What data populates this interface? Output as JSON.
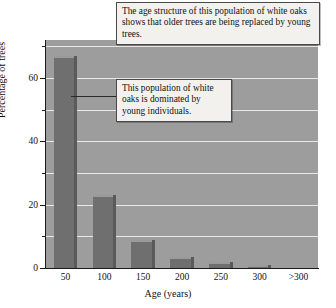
{
  "chart_data": {
    "type": "bar",
    "title": "",
    "xlabel": "Age (years)",
    "ylabel": "Percentage of trees",
    "categories": [
      "50",
      "100",
      "150",
      "200",
      "250",
      "300",
      ">300"
    ],
    "values": [
      67,
      23,
      9,
      3.5,
      2,
      0.8,
      0
    ],
    "ylim": [
      0,
      72
    ],
    "yticks_major": [
      0,
      20,
      40,
      60
    ],
    "yticks_minor": [
      10,
      30,
      50,
      70
    ],
    "ytick_labels": [
      "0",
      "20",
      "40",
      "60"
    ],
    "grid": "horizontal white gridlines every 10 units",
    "legend": "none",
    "colors": {
      "plot_background": "#9d9d9d",
      "bar_fill": "#6f6f6f",
      "bar_highlight": "#9a9a9a",
      "bar_shadow": "#5a5a5a",
      "gridline": "#e8e8e8",
      "axis": "#1b1b1b",
      "page_background": "#ffffff",
      "callout_background": "#f2f1ee",
      "callout_border": "#4a4a4a"
    },
    "annotations": [
      {
        "name": "top-callout",
        "text": "The age structure of this population of white oaks shows that older trees are being replaced by young trees."
      },
      {
        "name": "middle-callout",
        "text": "This population of white oaks is dominated by young individuals.",
        "points_to": "50"
      }
    ]
  },
  "annotations": {
    "top": "The age structure of this population of white oaks shows that older trees are being replaced by young trees.",
    "middle": "This population of white oaks is dominated by young individuals."
  },
  "axes": {
    "x_title": "Age (years)",
    "y_title": "Percentage of trees"
  }
}
